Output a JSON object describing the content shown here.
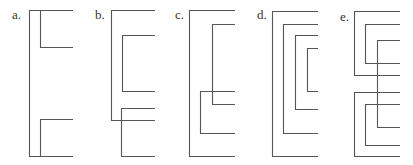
{
  "figure": {
    "panels": [
      {
        "label": "a.",
        "label_pos": [
          12,
          10
        ],
        "brackets": [
          {
            "x": 29,
            "y1": 10,
            "y2": 156,
            "xr": 73
          },
          {
            "x": 40,
            "y1": 10,
            "y2": 47,
            "xr": 73
          },
          {
            "x": 40,
            "y1": 119,
            "y2": 156,
            "xr": 73
          }
        ]
      },
      {
        "label": "b.",
        "label_pos": [
          95,
          10
        ],
        "brackets": [
          {
            "x": 111,
            "y1": 10,
            "y2": 120,
            "xr": 155
          },
          {
            "x": 122,
            "y1": 35,
            "y2": 91,
            "xr": 155
          },
          {
            "x": 121,
            "y1": 108,
            "y2": 156,
            "xr": 155
          }
        ]
      },
      {
        "label": "c.",
        "label_pos": [
          175,
          10
        ],
        "brackets": [
          {
            "x": 189,
            "y1": 10,
            "y2": 156,
            "xr": 235
          },
          {
            "x": 212,
            "y1": 24,
            "y2": 104,
            "xr": 235
          },
          {
            "x": 200,
            "y1": 91,
            "y2": 133,
            "xr": 235
          }
        ]
      },
      {
        "label": "d.",
        "label_pos": [
          257,
          10
        ],
        "brackets": [
          {
            "x": 272,
            "y1": 11,
            "y2": 156,
            "xr": 318
          },
          {
            "x": 283,
            "y1": 24,
            "y2": 133,
            "xr": 318
          },
          {
            "x": 295,
            "y1": 35,
            "y2": 109,
            "xr": 318
          },
          {
            "x": 307,
            "y1": 48,
            "y2": 91,
            "xr": 318
          }
        ]
      },
      {
        "label": "e.",
        "label_pos": [
          340,
          12
        ],
        "brackets": [
          {
            "x": 354,
            "y1": 11,
            "y2": 75,
            "xr": 400
          },
          {
            "x": 365,
            "y1": 24,
            "y2": 63,
            "xr": 400
          },
          {
            "x": 377,
            "y1": 40,
            "y2": 127,
            "xr": 400
          },
          {
            "x": 354,
            "y1": 92,
            "y2": 156,
            "xr": 400
          },
          {
            "x": 365,
            "y1": 104,
            "y2": 145,
            "xr": 400
          }
        ]
      }
    ],
    "stroke_color": "#555555",
    "label_color": "#333333"
  }
}
